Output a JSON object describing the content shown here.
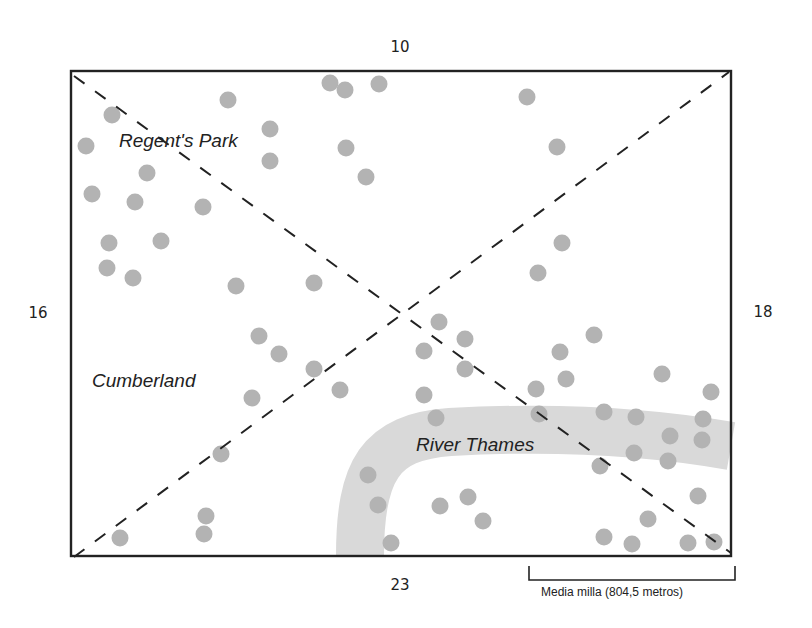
{
  "diagram": {
    "type": "map-quadrant-dot-diagram",
    "frame": {
      "x1": 71,
      "y1": 71,
      "x2": 731,
      "y2": 556,
      "stroke": "#222222"
    },
    "diagonals": [
      {
        "from": [
          74,
          76
        ],
        "to": [
          731,
          553
        ]
      },
      {
        "from": [
          74,
          557
        ],
        "to": [
          729,
          72
        ]
      }
    ],
    "river": {
      "name": "River Thames",
      "color": "#d9d9d9",
      "path": "M 360 556 C 360 470, 380 437, 450 432 C 540 427, 640 430, 731 446",
      "width": 48
    },
    "dot_color": "#b3b3b3",
    "dot_radius": 8.5,
    "dots": [
      [
        86,
        146
      ],
      [
        112,
        115
      ],
      [
        147,
        173
      ],
      [
        92,
        194
      ],
      [
        135,
        202
      ],
      [
        203,
        207
      ],
      [
        109,
        243
      ],
      [
        161,
        241
      ],
      [
        107,
        268
      ],
      [
        133,
        278
      ],
      [
        228,
        100
      ],
      [
        270,
        129
      ],
      [
        270,
        161
      ],
      [
        236,
        286
      ],
      [
        314,
        283
      ],
      [
        330,
        83
      ],
      [
        345,
        90
      ],
      [
        379,
        84
      ],
      [
        346,
        148
      ],
      [
        366,
        177
      ],
      [
        527,
        97
      ],
      [
        557,
        147
      ],
      [
        562,
        243
      ],
      [
        538,
        273
      ],
      [
        259,
        336
      ],
      [
        279,
        354
      ],
      [
        314,
        369
      ],
      [
        340,
        390
      ],
      [
        252,
        398
      ],
      [
        221,
        454
      ],
      [
        439,
        322
      ],
      [
        465,
        339
      ],
      [
        424,
        351
      ],
      [
        465,
        369
      ],
      [
        424,
        395
      ],
      [
        436,
        418
      ],
      [
        594,
        335
      ],
      [
        560,
        352
      ],
      [
        566,
        379
      ],
      [
        536,
        389
      ],
      [
        539,
        414
      ],
      [
        662,
        374
      ],
      [
        711,
        392
      ],
      [
        604,
        412
      ],
      [
        636,
        417
      ],
      [
        703,
        419
      ],
      [
        670,
        436
      ],
      [
        702,
        440
      ],
      [
        634,
        453
      ],
      [
        668,
        461
      ],
      [
        600,
        466
      ],
      [
        698,
        496
      ],
      [
        648,
        519
      ],
      [
        604,
        537
      ],
      [
        632,
        544
      ],
      [
        688,
        543
      ],
      [
        714,
        542
      ],
      [
        368,
        475
      ],
      [
        378,
        505
      ],
      [
        391,
        543
      ],
      [
        440,
        506
      ],
      [
        468,
        497
      ],
      [
        483,
        521
      ],
      [
        120,
        538
      ],
      [
        206,
        516
      ],
      [
        204,
        534
      ]
    ]
  },
  "counts": {
    "top": {
      "value": "10",
      "x": 400,
      "y": 47
    },
    "left": {
      "value": "16",
      "x": 38,
      "y": 313
    },
    "right": {
      "value": "18",
      "x": 763,
      "y": 312
    },
    "bottom": {
      "value": "23",
      "x": 400,
      "y": 585
    }
  },
  "regions": {
    "regents_park": {
      "label": "Regent's Park",
      "x": 119,
      "y": 130
    },
    "cumberland": {
      "label": "Cumberland",
      "x": 92,
      "y": 370
    },
    "river_thames": {
      "label": "River Thames",
      "x": 416,
      "y": 434
    }
  },
  "scale_bar": {
    "x1": 529,
    "x2": 735,
    "y_top": 566,
    "y_bottom": 580,
    "caption": "Media milla (804,5 metros)",
    "caption_x": 541,
    "caption_y": 585
  }
}
